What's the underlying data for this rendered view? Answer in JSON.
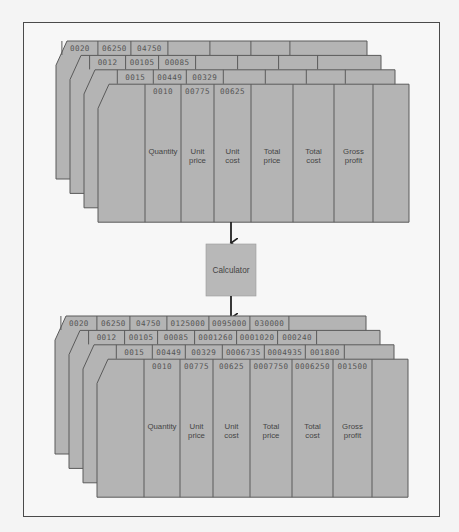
{
  "colors": {
    "card_fill": "#b4b4b4",
    "card_stroke": "#5a5a5a",
    "frame": "#4a4a4a",
    "background": "#f7f7f7",
    "calculator_fill": "#b8b8b8"
  },
  "columns": [
    "Quantity",
    "Unit price",
    "Unit cost",
    "Total price",
    "Total cost",
    "Gross profit"
  ],
  "column_labels": [
    {
      "line1": "Quantity",
      "line2": ""
    },
    {
      "line1": "Unit",
      "line2": "price"
    },
    {
      "line1": "Unit",
      "line2": "cost"
    },
    {
      "line1": "Total",
      "line2": "price"
    },
    {
      "line1": "Total",
      "line2": "cost"
    },
    {
      "line1": "Gross",
      "line2": "profit"
    }
  ],
  "calculator": {
    "label": "Calculator"
  },
  "input_deck": {
    "cards": [
      {
        "values": [
          "0020",
          "06250",
          "04750",
          "",
          "",
          ""
        ]
      },
      {
        "values": [
          "0012",
          "00105",
          "00085",
          "",
          "",
          ""
        ]
      },
      {
        "values": [
          "0015",
          "00449",
          "00329",
          "",
          "",
          ""
        ]
      },
      {
        "values": [
          "0010",
          "00775",
          "00625",
          "",
          "",
          ""
        ]
      }
    ]
  },
  "output_deck": {
    "cards": [
      {
        "values": [
          "0020",
          "06250",
          "04750",
          "0125000",
          "0095000",
          "030000"
        ]
      },
      {
        "values": [
          "0012",
          "00105",
          "00085",
          "0001260",
          "0001020",
          "000240"
        ]
      },
      {
        "values": [
          "0015",
          "00449",
          "00329",
          "0006735",
          "0004935",
          "001800"
        ]
      },
      {
        "values": [
          "0010",
          "00775",
          "00625",
          "0007750",
          "0006250",
          "001500"
        ]
      }
    ]
  }
}
